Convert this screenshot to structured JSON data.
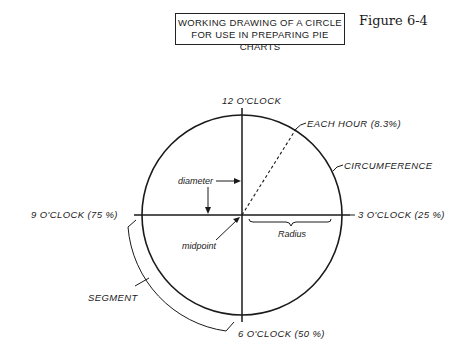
{
  "title": {
    "line1": "WORKING DRAWING OF A CIRCLE",
    "line2": "FOR USE IN PREPARING PIE CHARTS"
  },
  "figure_label": "Figure 6-4",
  "labels": {
    "twelve": "12 O'CLOCK",
    "three": "3 O'CLOCK (25 %)",
    "six": "6 O'CLOCK (50 %)",
    "nine": "9 O'CLOCK (75 %)",
    "each_hour": "EACH HOUR (8.3%)",
    "circumference": "CIRCUMFERENCE",
    "diameter": "diameter",
    "midpoint": "midpoint",
    "radius": "Radius",
    "segment": "SEGMENT"
  },
  "colors": {
    "ink": "#1a1a1a",
    "background": "#ffffff"
  }
}
